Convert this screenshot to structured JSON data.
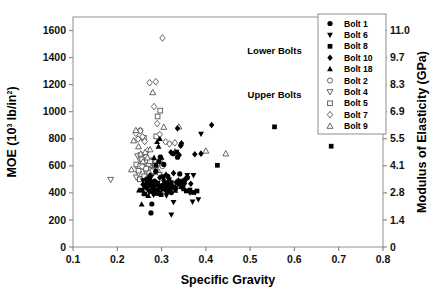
{
  "chart_data": {
    "type": "scatter",
    "title": "",
    "xlabel": "Specific Gravity",
    "ylabel": "MOE (10^3 lb/in^2)",
    "y2label": "Modulus of Elasticity (GPa)",
    "xlim": [
      0.1,
      0.8
    ],
    "ylim": [
      0,
      1700
    ],
    "y2lim": [
      0,
      11.72
    ],
    "grid": false,
    "legend_position": "top-right",
    "xticks": [
      "0.1",
      "0.2",
      "0.3",
      "0.4",
      "0.5",
      "0.6",
      "0.7",
      "0.8"
    ],
    "xtick_values": [
      0.1,
      0.2,
      0.3,
      0.4,
      0.5,
      0.6,
      0.7,
      0.8
    ],
    "yticks": [
      "0",
      "200",
      "400",
      "600",
      "800",
      "1000",
      "1200",
      "1400",
      "1600"
    ],
    "ytick_values": [
      0,
      200,
      400,
      600,
      800,
      1000,
      1200,
      1400,
      1600
    ],
    "y2ticks": [
      "0",
      "1.4",
      "2.8",
      "4.1",
      "5.5",
      "6.9",
      "8.3",
      "9.7",
      "11.0"
    ],
    "y2tick_values": [
      0,
      200,
      400,
      600,
      800,
      1000,
      1200,
      1400,
      1600
    ],
    "annotations": [
      {
        "text": "Lower Bolts",
        "x": 0.555,
        "y": 1430
      },
      {
        "text": "Upper Bolts",
        "x": 0.555,
        "y": 1098
      }
    ],
    "ylabel_parts": {
      "pre": "MOE (10",
      "sup": "3",
      "mid": " lb/in",
      "sup2": "2",
      "post": ")"
    },
    "series": [
      {
        "name": "Bolt 1",
        "marker": "circle",
        "fill": "solid",
        "color": "#000000",
        "points": [
          [
            0.262,
            452
          ],
          [
            0.268,
            470
          ],
          [
            0.272,
            509
          ],
          [
            0.276,
            252
          ],
          [
            0.278,
            318
          ],
          [
            0.281,
            440
          ],
          [
            0.284,
            487
          ],
          [
            0.287,
            560
          ],
          [
            0.289,
            415
          ],
          [
            0.292,
            398
          ],
          [
            0.294,
            632
          ],
          [
            0.297,
            665
          ],
          [
            0.299,
            452
          ],
          [
            0.302,
            430
          ],
          [
            0.305,
            610
          ],
          [
            0.308,
            474
          ],
          [
            0.311,
            418
          ],
          [
            0.314,
            523
          ],
          [
            0.318,
            447
          ],
          [
            0.322,
            402
          ],
          [
            0.326,
            690
          ],
          [
            0.331,
            436
          ],
          [
            0.336,
            664
          ],
          [
            0.341,
            540
          ],
          [
            0.346,
            448
          ],
          [
            0.352,
            494
          ],
          [
            0.358,
            511
          ]
        ]
      },
      {
        "name": "Bolt 6",
        "marker": "triangle-down",
        "fill": "solid",
        "color": "#000000",
        "points": [
          [
            0.258,
            492
          ],
          [
            0.263,
            462
          ],
          [
            0.268,
            430
          ],
          [
            0.272,
            405
          ],
          [
            0.277,
            520
          ],
          [
            0.282,
            385
          ],
          [
            0.286,
            448
          ],
          [
            0.291,
            471
          ],
          [
            0.295,
            398
          ],
          [
            0.3,
            432
          ],
          [
            0.305,
            455
          ],
          [
            0.311,
            380
          ],
          [
            0.316,
            412
          ],
          [
            0.322,
            239
          ],
          [
            0.327,
            331
          ],
          [
            0.333,
            424
          ],
          [
            0.34,
            488
          ],
          [
            0.346,
            434
          ],
          [
            0.352,
            460
          ],
          [
            0.358,
            531
          ],
          [
            0.364,
            399
          ],
          [
            0.37,
            334
          ],
          [
            0.376,
            404
          ],
          [
            0.383,
            351
          ],
          [
            0.389,
            836
          ],
          [
            0.372,
            530
          ]
        ]
      },
      {
        "name": "Bolt 8",
        "marker": "square",
        "fill": "solid",
        "color": "#000000",
        "points": [
          [
            0.256,
            420
          ],
          [
            0.262,
            392
          ],
          [
            0.267,
            438
          ],
          [
            0.271,
            468
          ],
          [
            0.275,
            412
          ],
          [
            0.279,
            455
          ],
          [
            0.283,
            398
          ],
          [
            0.287,
            604
          ],
          [
            0.291,
            420
          ],
          [
            0.295,
            445
          ],
          [
            0.299,
            387
          ],
          [
            0.303,
            520
          ],
          [
            0.307,
            462
          ],
          [
            0.312,
            430
          ],
          [
            0.317,
            498
          ],
          [
            0.322,
            476
          ],
          [
            0.328,
            445
          ],
          [
            0.334,
            702
          ],
          [
            0.34,
            463
          ],
          [
            0.347,
            480
          ],
          [
            0.356,
            414
          ],
          [
            0.364,
            421
          ],
          [
            0.372,
            403
          ],
          [
            0.38,
            414
          ],
          [
            0.426,
            604
          ],
          [
            0.555,
            888
          ],
          [
            0.683,
            745
          ]
        ]
      },
      {
        "name": "Bolt 10",
        "marker": "diamond",
        "fill": "solid",
        "color": "#000000",
        "points": [
          [
            0.258,
            462
          ],
          [
            0.264,
            498
          ],
          [
            0.269,
            447
          ],
          [
            0.274,
            530
          ],
          [
            0.278,
            480
          ],
          [
            0.282,
            436
          ],
          [
            0.287,
            556
          ],
          [
            0.291,
            470
          ],
          [
            0.296,
            512
          ],
          [
            0.3,
            444
          ],
          [
            0.305,
            491
          ],
          [
            0.31,
            533
          ],
          [
            0.315,
            466
          ],
          [
            0.321,
            700
          ],
          [
            0.327,
            546
          ],
          [
            0.333,
            478
          ],
          [
            0.34,
            680
          ],
          [
            0.345,
            767
          ],
          [
            0.343,
            748
          ],
          [
            0.352,
            495
          ],
          [
            0.358,
            519
          ],
          [
            0.366,
            467
          ],
          [
            0.375,
            686
          ],
          [
            0.389,
            690
          ],
          [
            0.413,
            902
          ],
          [
            0.336,
            877
          ]
        ]
      },
      {
        "name": "Bolt 18",
        "marker": "triangle-up",
        "fill": "solid",
        "color": "#000000",
        "points": [
          [
            0.249,
            420
          ],
          [
            0.255,
            316
          ],
          [
            0.26,
            398
          ],
          [
            0.265,
            448
          ],
          [
            0.27,
            378
          ],
          [
            0.274,
            501
          ],
          [
            0.278,
            430
          ],
          [
            0.282,
            466
          ],
          [
            0.286,
            398
          ],
          [
            0.29,
            778
          ],
          [
            0.293,
            742
          ],
          [
            0.296,
            800
          ],
          [
            0.3,
            662
          ],
          [
            0.304,
            428
          ],
          [
            0.309,
            452
          ],
          [
            0.314,
            410
          ],
          [
            0.319,
            470
          ],
          [
            0.325,
            438
          ],
          [
            0.331,
            418
          ],
          [
            0.338,
            495
          ],
          [
            0.345,
            445
          ],
          [
            0.352,
            428
          ],
          [
            0.27,
            452
          ],
          [
            0.283,
            660
          ]
        ]
      },
      {
        "name": "Bolt 2",
        "marker": "circle",
        "fill": "open",
        "color": "#555555",
        "points": [
          [
            0.247,
            590
          ],
          [
            0.252,
            652
          ],
          [
            0.257,
            618
          ],
          [
            0.262,
            585
          ],
          [
            0.266,
            560
          ],
          [
            0.271,
            612
          ],
          [
            0.276,
            640
          ],
          [
            0.281,
            575
          ],
          [
            0.286,
            602
          ],
          [
            0.291,
            558
          ],
          [
            0.296,
            636
          ],
          [
            0.302,
            598
          ],
          [
            0.252,
            862
          ]
        ]
      },
      {
        "name": "Bolt 4",
        "marker": "triangle-down",
        "fill": "open",
        "color": "#555555",
        "points": [
          [
            0.185,
            498
          ],
          [
            0.243,
            516
          ],
          [
            0.248,
            543
          ],
          [
            0.253,
            680
          ],
          [
            0.258,
            505
          ],
          [
            0.262,
            660
          ],
          [
            0.267,
            538
          ],
          [
            0.272,
            572
          ],
          [
            0.277,
            625
          ],
          [
            0.283,
            552
          ],
          [
            0.289,
            588
          ],
          [
            0.295,
            534
          ],
          [
            0.246,
            672
          ]
        ]
      },
      {
        "name": "Bolt 5",
        "marker": "square",
        "fill": "open",
        "color": "#555555",
        "points": [
          [
            0.243,
            610
          ],
          [
            0.248,
            565
          ],
          [
            0.252,
            598
          ],
          [
            0.256,
            648
          ],
          [
            0.261,
            522
          ],
          [
            0.265,
            580
          ],
          [
            0.269,
            440
          ],
          [
            0.274,
            635
          ],
          [
            0.279,
            560
          ],
          [
            0.285,
            602
          ],
          [
            0.291,
            965
          ],
          [
            0.297,
            1008
          ],
          [
            0.288,
            818
          ],
          [
            0.26,
            806
          ],
          [
            0.251,
            500
          ]
        ]
      },
      {
        "name": "Bolt 7",
        "marker": "diamond",
        "fill": "open",
        "color": "#555555",
        "points": [
          [
            0.242,
            840
          ],
          [
            0.247,
            798
          ],
          [
            0.252,
            858
          ],
          [
            0.257,
            815
          ],
          [
            0.262,
            780
          ],
          [
            0.268,
            712
          ],
          [
            0.273,
            1214
          ],
          [
            0.287,
            1222
          ],
          [
            0.283,
            1038
          ],
          [
            0.29,
            912
          ],
          [
            0.296,
            832
          ],
          [
            0.302,
            1545
          ],
          [
            0.309,
            778
          ],
          [
            0.318,
            762
          ],
          [
            0.33,
            770
          ],
          [
            0.344,
            755
          ],
          [
            0.265,
            668
          ],
          [
            0.256,
            596
          ],
          [
            0.272,
            546
          ]
        ]
      },
      {
        "name": "Bolt 9",
        "marker": "triangle-up",
        "fill": "open",
        "color": "#555555",
        "points": [
          [
            0.237,
            786
          ],
          [
            0.242,
            862
          ],
          [
            0.248,
            742
          ],
          [
            0.253,
            688
          ],
          [
            0.258,
            632
          ],
          [
            0.263,
            700
          ],
          [
            0.268,
            660
          ],
          [
            0.274,
            720
          ],
          [
            0.28,
            1142
          ],
          [
            0.305,
            886
          ],
          [
            0.339,
            888
          ],
          [
            0.4,
            710
          ],
          [
            0.445,
            690
          ],
          [
            0.33,
            705
          ],
          [
            0.29,
            618
          ],
          [
            0.232,
            572
          ]
        ]
      }
    ]
  },
  "legend": {
    "items": [
      {
        "label": "Bolt 1",
        "marker": "circle",
        "fill": "solid"
      },
      {
        "label": "Bolt 6",
        "marker": "triangle-down",
        "fill": "solid"
      },
      {
        "label": "Bolt 8",
        "marker": "square",
        "fill": "solid"
      },
      {
        "label": "Bolt 10",
        "marker": "diamond",
        "fill": "solid"
      },
      {
        "label": "Bolt 18",
        "marker": "triangle-up",
        "fill": "solid"
      },
      {
        "label": "Bolt 2",
        "marker": "circle",
        "fill": "open"
      },
      {
        "label": "Bolt 4",
        "marker": "triangle-down",
        "fill": "open"
      },
      {
        "label": "Bolt 5",
        "marker": "square",
        "fill": "open"
      },
      {
        "label": "Bolt 7",
        "marker": "diamond",
        "fill": "open"
      },
      {
        "label": "Bolt 9",
        "marker": "triangle-up",
        "fill": "open"
      }
    ]
  },
  "colors": {
    "ink": "#000000",
    "frame": "#9a9a9a",
    "open_marker": "#555555"
  }
}
